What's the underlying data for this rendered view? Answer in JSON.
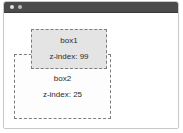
{
  "window": {
    "titlebar": {
      "controls": [
        {
          "name": "window-control-close",
          "icon": "circle-dot-icon"
        },
        {
          "name": "window-control-minimize",
          "icon": "circle-dot-icon"
        }
      ]
    }
  },
  "canvas": {
    "boxes": [
      {
        "id": "box1",
        "title": "box1",
        "zindex_label": "z-index: 99",
        "zindex": 99,
        "fill": "#e4e4e4",
        "border_color": "#7d7d7d",
        "border_style": "dashed"
      },
      {
        "id": "box2",
        "title": "box2",
        "zindex_label": "z-index: 25",
        "zindex": 25,
        "fill": "#fdfdfd",
        "border_color": "#7d7d7d",
        "border_style": "dashed"
      }
    ]
  },
  "colors": {
    "titlebar_bg": "#4b4b4b",
    "window_border": "#c9c9c9",
    "page_bg": "#ffffff",
    "text": "#2b2b2b"
  }
}
